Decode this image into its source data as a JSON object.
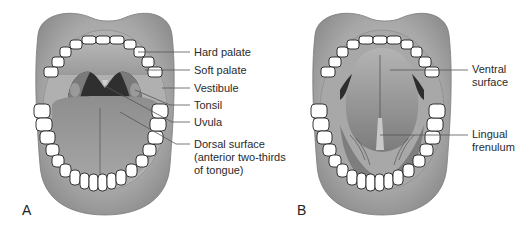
{
  "figure": {
    "panels": [
      {
        "id": "A",
        "letter": "A",
        "view": "open mouth, tongue down (dorsal view)",
        "labels": [
          {
            "text": "Hard palate"
          },
          {
            "text": "Soft palate"
          },
          {
            "text": "Vestibule"
          },
          {
            "text": "Tonsil"
          },
          {
            "text": "Uvula"
          },
          {
            "text": "Dorsal surface",
            "line2": "(anterior two-thirds",
            "line3": "of tongue)"
          }
        ]
      },
      {
        "id": "B",
        "letter": "B",
        "view": "open mouth, tongue raised (ventral view)",
        "labels": [
          {
            "text": "Ventral",
            "line2": "surface"
          },
          {
            "text": "Lingual",
            "line2": "frenulum"
          }
        ]
      }
    ],
    "colors": {
      "lip": "#a9a9a9",
      "lip_shadow": "#8c8c8c",
      "oral_cavity": "#9c9c9c",
      "tongue": "#8a8a8a",
      "teeth": "#ffffff",
      "outline": "#222222",
      "leader_line": "#555555",
      "text": "#2a2a2a"
    }
  }
}
